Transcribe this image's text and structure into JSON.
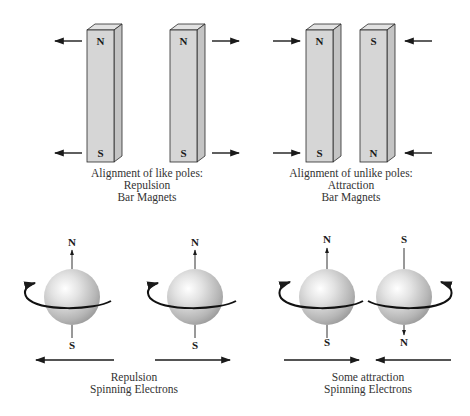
{
  "panels": [
    {
      "id": "like-poles",
      "magnets": [
        {
          "top": "N",
          "bottom": "S"
        },
        {
          "top": "N",
          "bottom": "S"
        }
      ],
      "force_direction": "outward",
      "caption": [
        "Alignment of like poles:",
        "Repulsion",
        "Bar Magnets"
      ]
    },
    {
      "id": "unlike-poles",
      "magnets": [
        {
          "top": "N",
          "bottom": "S"
        },
        {
          "top": "S",
          "bottom": "N"
        }
      ],
      "force_direction": "inward",
      "caption": [
        "Alignment of unlike poles:",
        "Attraction",
        "Bar Magnets"
      ]
    },
    {
      "id": "repulsion-electrons",
      "electrons": [
        {
          "top": "N",
          "bottom": "S",
          "arrow_end": "top",
          "spin": "counterclockwise"
        },
        {
          "top": "N",
          "bottom": "S",
          "arrow_end": "top",
          "spin": "counterclockwise"
        }
      ],
      "force_direction": "outward",
      "caption": [
        "Repulsion",
        "Spinning Electrons"
      ]
    },
    {
      "id": "attraction-electrons",
      "electrons": [
        {
          "top": "N",
          "bottom": "S",
          "arrow_end": "top",
          "spin": "counterclockwise"
        },
        {
          "top": "S",
          "bottom": "N",
          "arrow_end": "bottom",
          "spin": "clockwise"
        }
      ],
      "force_direction": "inward",
      "caption": [
        "Some attraction",
        "Spinning Electrons"
      ]
    }
  ],
  "colors": {
    "magnet_face": "#d6d6d6",
    "magnet_side": "#c4c4c4",
    "sphere_light": "#ffffff",
    "sphere_dark": "#9a9a9a",
    "ink": "#1a1a1a"
  }
}
